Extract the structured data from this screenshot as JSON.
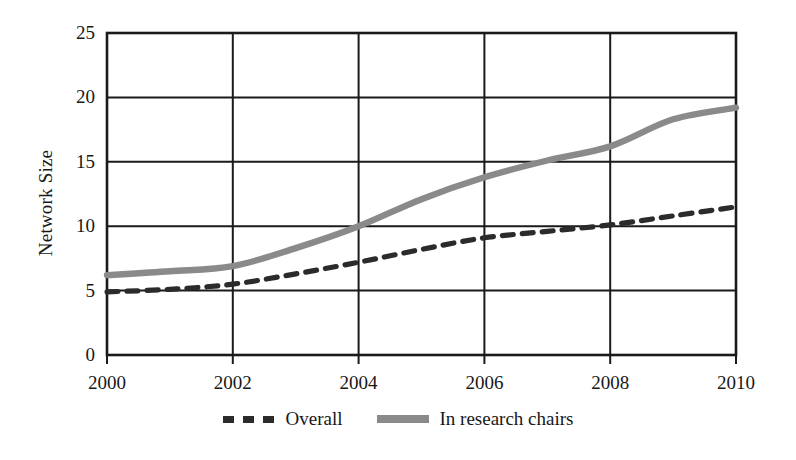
{
  "chart_data": {
    "type": "line",
    "title": "",
    "xlabel": "",
    "ylabel": "Network Size",
    "xlim": [
      2000,
      2010
    ],
    "ylim": [
      0,
      25
    ],
    "x_ticks": [
      "2000",
      "2002",
      "2004",
      "2006",
      "2008",
      "2010"
    ],
    "x_tick_values": [
      2000,
      2002,
      2004,
      2006,
      2008,
      2010
    ],
    "y_ticks": [
      "0",
      "5",
      "10",
      "15",
      "20",
      "25"
    ],
    "y_tick_values": [
      0,
      5,
      10,
      15,
      20,
      25
    ],
    "grid": "both",
    "legend_position": "bottom-center",
    "x": [
      2000,
      2001,
      2002,
      2003,
      2004,
      2005,
      2006,
      2007,
      2008,
      2009,
      2010
    ],
    "series": [
      {
        "name": "Overall",
        "style": "dashed",
        "color": "#2b2b2b",
        "values": [
          4.9,
          5.1,
          5.5,
          6.3,
          7.2,
          8.2,
          9.1,
          9.6,
          10.1,
          10.8,
          11.5
        ]
      },
      {
        "name": "In research chairs",
        "style": "solid",
        "color": "#8a8a8a",
        "values": [
          6.2,
          6.5,
          6.9,
          8.3,
          10.0,
          12.1,
          13.8,
          15.1,
          16.2,
          18.3,
          19.2
        ]
      }
    ]
  },
  "axis": {
    "y_title": "Network Size"
  },
  "legend": {
    "items": [
      {
        "label": "Overall",
        "color": "#2b2b2b",
        "style": "dashed"
      },
      {
        "label": "In research chairs",
        "color": "#8a8a8a",
        "style": "solid"
      }
    ]
  },
  "colors": {
    "overall": "#2b2b2b",
    "research_chairs": "#8a8a8a",
    "axis": "#1a1a1a",
    "background": "#ffffff"
  }
}
